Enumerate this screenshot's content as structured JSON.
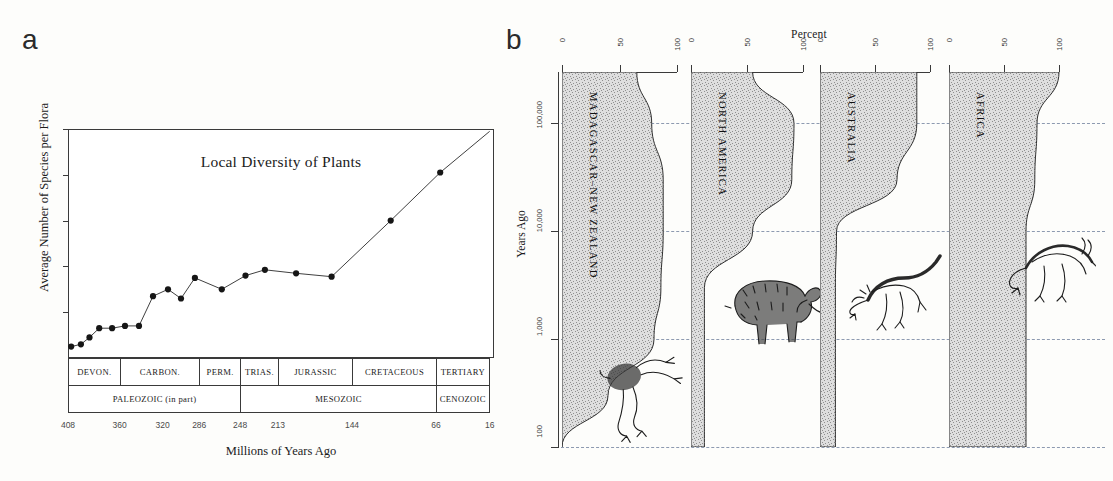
{
  "figure": {
    "panel_a_letter": "a",
    "panel_b_letter": "b"
  },
  "panel_a": {
    "title": "Local Diversity of Plants",
    "ylabel": "Average Number of Species per Flora",
    "xlabel": "Millions of Years Ago",
    "yticks": [
      "20",
      "40",
      "60",
      "80",
      "100"
    ],
    "xticks": [
      "408",
      "360",
      "320",
      "286",
      "248",
      "213",
      "144",
      "66",
      "16"
    ],
    "periods": [
      "DEVON.",
      "CARBON.",
      "PERM.",
      "TRIAS.",
      "JURASSIC",
      "CRETACEOUS",
      "TERTIARY"
    ],
    "eras": [
      "PALEOZOIC (in part)",
      "MESOZOIC",
      "CENOZOIC"
    ]
  },
  "panel_b": {
    "title": "Percent",
    "ylabel": "Years Ago",
    "yticks": [
      "100,000",
      "10,000",
      "1,000",
      "100"
    ],
    "xticks": [
      "0",
      "50",
      "100"
    ],
    "columns": [
      {
        "name": "MADAGASCAR–NEW ZEALAND",
        "animal": "moa-bird-illustration"
      },
      {
        "name": "NORTH AMERICA",
        "animal": "mammoth-illustration"
      },
      {
        "name": "AUSTRALIA",
        "animal": "marsupial-illustration"
      },
      {
        "name": "AFRICA",
        "animal": "antelope-illustration"
      }
    ]
  },
  "chart_data": [
    {
      "type": "line",
      "title": "Local Diversity of Plants",
      "xlabel": "Millions of Years Ago",
      "ylabel": "Average Number of Species per Flora",
      "xlim": [
        408,
        12
      ],
      "ylim": [
        0,
        100
      ],
      "x_inverted": true,
      "grid": false,
      "legend": "none",
      "x": [
        405,
        396,
        387,
        378,
        366,
        354,
        342,
        327,
        312,
        300,
        288,
        272,
        252,
        235,
        218,
        200,
        178,
        150,
        95,
        40
      ],
      "y": [
        5,
        6,
        9,
        13,
        13,
        14,
        14,
        27,
        30,
        26,
        35,
        30,
        36,
        38.5,
        37,
        35.5,
        60,
        81,
        97,
        97
      ],
      "series": [
        {
          "name": "Average number of species per flora",
          "points": [
            {
              "x": 405,
              "y": 5
            },
            {
              "x": 396,
              "y": 6
            },
            {
              "x": 388,
              "y": 9
            },
            {
              "x": 379,
              "y": 13
            },
            {
              "x": 367,
              "y": 13
            },
            {
              "x": 355,
              "y": 14
            },
            {
              "x": 342,
              "y": 14
            },
            {
              "x": 329,
              "y": 27
            },
            {
              "x": 315,
              "y": 30
            },
            {
              "x": 303,
              "y": 26
            },
            {
              "x": 290,
              "y": 35
            },
            {
              "x": 265,
              "y": 30
            },
            {
              "x": 243,
              "y": 36
            },
            {
              "x": 225,
              "y": 38.5
            },
            {
              "x": 196,
              "y": 37
            },
            {
              "x": 163,
              "y": 35.5
            },
            {
              "x": 108,
              "y": 60
            },
            {
              "x": 62,
              "y": 81
            }
          ]
        }
      ],
      "timescale": {
        "periods": [
          {
            "label": "DEVON.",
            "from": 408,
            "to": 360
          },
          {
            "label": "CARBON.",
            "from": 360,
            "to": 286
          },
          {
            "label": "PERM.",
            "from": 286,
            "to": 248
          },
          {
            "label": "TRIAS.",
            "from": 248,
            "to": 213
          },
          {
            "label": "JURASSIC",
            "from": 213,
            "to": 144
          },
          {
            "label": "CRETACEOUS",
            "from": 144,
            "to": 66
          },
          {
            "label": "TERTIARY",
            "from": 66,
            "to": 16
          }
        ],
        "eras": [
          {
            "label": "PALEOZOIC (in part)",
            "from": 408,
            "to": 248
          },
          {
            "label": "MESOZOIC",
            "from": 248,
            "to": 66
          },
          {
            "label": "CENOZOIC",
            "from": 66,
            "to": 16
          }
        ]
      }
    },
    {
      "type": "area",
      "title": "Percent",
      "xlabel": "Percent",
      "ylabel": "Years Ago",
      "xlim": [
        0,
        100
      ],
      "ylim_log": [
        100,
        300000
      ],
      "y_log_scale": true,
      "grid": "horizontal-dashed",
      "note": "Width of each shaded column = percent of large mammal/bird genera surviving through time on each landmass.",
      "panels": [
        {
          "name": "MADAGASCAR–NEW ZEALAND",
          "y_values": [
            300000,
            100000,
            30000,
            10000,
            3000,
            1000,
            300,
            100
          ],
          "percent": [
            65,
            78,
            88,
            88,
            86,
            80,
            40,
            0
          ]
        },
        {
          "name": "NORTH AMERICA",
          "y_values": [
            300000,
            100000,
            30000,
            10000,
            3000,
            1000,
            300,
            100
          ],
          "percent": [
            55,
            92,
            90,
            55,
            12,
            12,
            12,
            12
          ]
        },
        {
          "name": "AUSTRALIA",
          "y_values": [
            300000,
            100000,
            30000,
            10000,
            3000,
            1000,
            300,
            100
          ],
          "percent": [
            88,
            88,
            70,
            15,
            14,
            14,
            14,
            14
          ]
        },
        {
          "name": "AFRICA",
          "y_values": [
            300000,
            100000,
            30000,
            10000,
            3000,
            1000,
            300,
            100
          ],
          "percent": [
            100,
            80,
            78,
            70,
            70,
            70,
            70,
            70
          ]
        }
      ]
    }
  ]
}
